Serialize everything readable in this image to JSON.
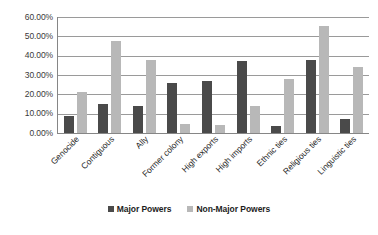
{
  "chart_data": {
    "type": "bar",
    "title": "",
    "subtitle": "",
    "xlabel": "",
    "ylabel": "",
    "ylim": [
      0,
      60
    ],
    "ytick_labels": [
      "60.00%",
      "50.00%",
      "40.00%",
      "30.00%",
      "20.00%",
      "10.00%",
      "0.00%"
    ],
    "ytick_values": [
      60,
      50,
      40,
      30,
      20,
      10,
      0
    ],
    "ytick_format": "percent",
    "grid": true,
    "grid_axis": "y",
    "legend_position": "bottom",
    "categories": [
      "Genocide",
      "Contiguous",
      "Ally",
      "Former colony",
      "High exports",
      "High imports",
      "Ethnic ties",
      "Religious ties",
      "Linguistic ties"
    ],
    "series": [
      {
        "name": "Major Powers",
        "color": "#4a4a4a",
        "values": [
          9.0,
          15.0,
          14.0,
          26.0,
          27.0,
          37.0,
          3.5,
          38.0,
          7.0
        ]
      },
      {
        "name": "Non-Major Powers",
        "color": "#b8b8b8",
        "values": [
          21.0,
          47.5,
          38.0,
          4.5,
          4.0,
          14.0,
          28.0,
          55.5,
          34.0
        ]
      }
    ]
  },
  "legend": {
    "items": [
      {
        "label": "Major Powers",
        "color": "#4a4a4a"
      },
      {
        "label": "Non-Major Powers",
        "color": "#b8b8b8"
      }
    ]
  },
  "colors": {
    "major": "#4a4a4a",
    "non_major": "#b8b8b8",
    "axis": "#868686",
    "grid": "#9a9a9a",
    "background": "#ffffff"
  }
}
